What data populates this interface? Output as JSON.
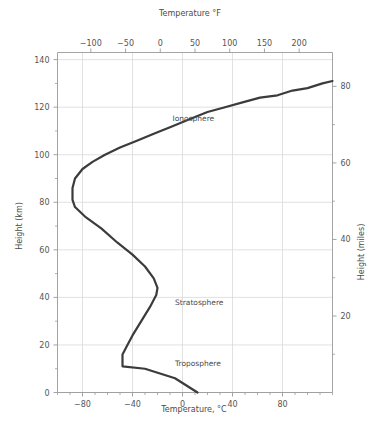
{
  "chart_data": {
    "type": "line",
    "title": "",
    "xlabel": "Temperature, °C",
    "ylabel": "Height (km)",
    "secondary_xlabel": "Temperature °F",
    "secondary_ylabel": "Height (miles)",
    "xlim": [
      -100,
      120
    ],
    "ylim": [
      0,
      143
    ],
    "xticks_c": [
      -80,
      -40,
      0,
      40,
      80
    ],
    "xticklabels_c": [
      "−80",
      "−40",
      "0",
      "40",
      "80"
    ],
    "xticks_f": [
      -150,
      -100,
      -50,
      0,
      50,
      100,
      150,
      200
    ],
    "xticklabels_f": [
      "−150",
      "−100",
      "−50",
      "0",
      "50",
      "100",
      "150",
      "200"
    ],
    "yticks_km": [
      0,
      20,
      40,
      60,
      80,
      100,
      120,
      140
    ],
    "yticklabels_km": [
      "0",
      "20",
      "40",
      "60",
      "80",
      "100",
      "120",
      "140"
    ],
    "yticks_miles": [
      20,
      40,
      60,
      80
    ],
    "yticklabels_miles": [
      "20",
      "40",
      "60",
      "80"
    ],
    "grid": true,
    "legend_position": "none",
    "line_color": "#3b3b3b",
    "grid_color": "#d9d9d9",
    "axis_color": "#9a9a9a",
    "series": [
      {
        "name": "Atmospheric temperature profile",
        "x_unit": "°C",
        "y_unit": "km",
        "points": [
          [
            12,
            0
          ],
          [
            -6,
            6
          ],
          [
            -30,
            10
          ],
          [
            -48,
            11
          ],
          [
            -48,
            16
          ],
          [
            -45,
            19
          ],
          [
            -40,
            24
          ],
          [
            -33,
            30
          ],
          [
            -26,
            36
          ],
          [
            -21,
            41
          ],
          [
            -20,
            44
          ],
          [
            -23,
            48
          ],
          [
            -30,
            53
          ],
          [
            -40,
            58
          ],
          [
            -52,
            63
          ],
          [
            -65,
            69
          ],
          [
            -78,
            74
          ],
          [
            -86,
            78
          ],
          [
            -88,
            81
          ],
          [
            -88,
            86
          ],
          [
            -86,
            90
          ],
          [
            -80,
            94
          ],
          [
            -72,
            97
          ],
          [
            -62,
            100
          ],
          [
            -50,
            103
          ],
          [
            -36,
            106
          ],
          [
            -22,
            109
          ],
          [
            -8,
            112
          ],
          [
            6,
            115
          ],
          [
            20,
            118
          ],
          [
            34,
            120
          ],
          [
            48,
            122
          ],
          [
            62,
            124
          ],
          [
            76,
            125
          ],
          [
            88,
            127
          ],
          [
            100,
            128
          ],
          [
            112,
            130
          ],
          [
            120,
            131
          ]
        ]
      }
    ],
    "annotations": [
      {
        "text": "Ionosphere",
        "x_c": -8,
        "y_km": 114
      },
      {
        "text": "Stratosphere",
        "x_c": -6,
        "y_km": 37
      },
      {
        "text": "Troposphere",
        "x_c": -6,
        "y_km": 11
      }
    ]
  }
}
